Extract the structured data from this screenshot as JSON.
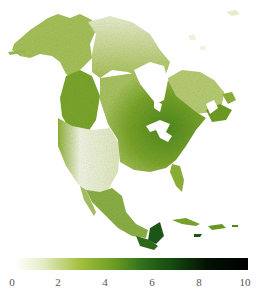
{
  "map": {
    "region": "North America",
    "background": "#ffffff",
    "ramp_colors": [
      "#ffffff",
      "#dfe8b8",
      "#8fb52a",
      "#4f8a1e",
      "#1e5a14",
      "#0c2a08",
      "#000000"
    ]
  },
  "colorbar": {
    "min": 0,
    "max": 10,
    "ticks": [
      {
        "value": "0",
        "x": 12
      },
      {
        "value": "2",
        "x": 58
      },
      {
        "value": "4",
        "x": 105
      },
      {
        "value": "6",
        "x": 152
      },
      {
        "value": "8",
        "x": 199
      },
      {
        "value": "10",
        "x": 245
      }
    ],
    "stops": [
      {
        "offset": "0%",
        "color": "#ffffff"
      },
      {
        "offset": "12%",
        "color": "#e4ecc4"
      },
      {
        "offset": "28%",
        "color": "#a3bf3c"
      },
      {
        "offset": "42%",
        "color": "#6f9e24"
      },
      {
        "offset": "55%",
        "color": "#2f6e1a"
      },
      {
        "offset": "68%",
        "color": "#15480f"
      },
      {
        "offset": "82%",
        "color": "#041204"
      },
      {
        "offset": "100%",
        "color": "#000000"
      }
    ]
  }
}
